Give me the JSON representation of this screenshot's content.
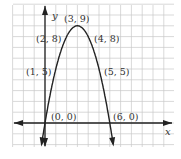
{
  "chart_data": {
    "type": "line",
    "title": "",
    "xlabel": "x",
    "ylabel": "y",
    "function": "y = -x^2 + 6x",
    "points": [
      {
        "x": 0,
        "y": 0,
        "label": "(0, 0)"
      },
      {
        "x": 1,
        "y": 5,
        "label": "(1, 5)"
      },
      {
        "x": 2,
        "y": 8,
        "label": "(2, 8)"
      },
      {
        "x": 3,
        "y": 9,
        "label": "(3, 9)"
      },
      {
        "x": 4,
        "y": 8,
        "label": "(4, 8)"
      },
      {
        "x": 5,
        "y": 5,
        "label": "(5, 5)"
      },
      {
        "x": 6,
        "y": 0,
        "label": "(6, 0)"
      }
    ],
    "xlim": [
      -3,
      12
    ],
    "ylim": [
      -2,
      11
    ],
    "grid": true,
    "legend": null
  },
  "axes": {
    "x_label": "x",
    "y_label": "y"
  },
  "colors": {
    "grid": "#c8c8c8",
    "axis": "#222222",
    "curve": "#222222",
    "background": "#ffffff"
  }
}
